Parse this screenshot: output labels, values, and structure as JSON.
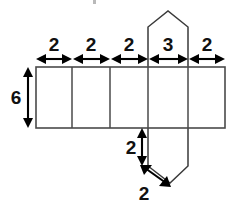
{
  "figure": {
    "title": "",
    "type": "geometry-net-diagram",
    "colors": {
      "background": "#ffffff",
      "outline": "#4a4a4a",
      "prism_outline": "#3a3a3a",
      "dimension": "#000000",
      "label_text": "#111111"
    },
    "dimensions": {
      "top": [
        {
          "name": "segment-1",
          "value": "2"
        },
        {
          "name": "segment-2",
          "value": "2"
        },
        {
          "name": "segment-3",
          "value": "2"
        },
        {
          "name": "segment-4",
          "value": "3"
        },
        {
          "name": "segment-5",
          "value": "2"
        }
      ],
      "left": {
        "name": "height",
        "value": "6"
      },
      "bottom_vertical": {
        "name": "flap-straight-side",
        "value": "2"
      },
      "bottom_diagonal": {
        "name": "flap-slant-side",
        "value": "2"
      }
    },
    "faces": [
      {
        "name": "face-1",
        "width_label": "2"
      },
      {
        "name": "face-2",
        "width_label": "2"
      },
      {
        "name": "face-3",
        "width_label": "2"
      },
      {
        "name": "face-4",
        "width_label": "3"
      },
      {
        "name": "face-5",
        "width_label": "2"
      }
    ],
    "flaps": [
      {
        "name": "upper-hexagon-flap"
      },
      {
        "name": "lower-hexagon-flap"
      }
    ]
  }
}
